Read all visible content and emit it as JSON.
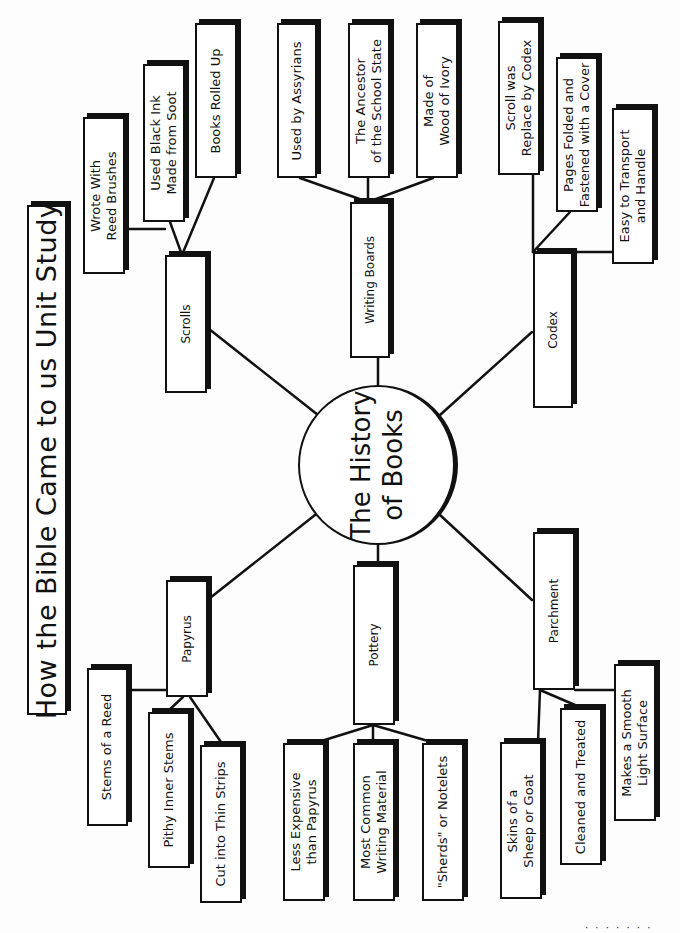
{
  "title": "How the Bible Came to us Unit Study",
  "center": {
    "label": "The History\nof Books"
  },
  "branches": {
    "scrolls": {
      "label": "Scrolls",
      "facts": [
        "Wrote With\nReed Brushes",
        "Used Black Ink\nMade from Soot",
        "Books Rolled Up"
      ]
    },
    "writing_boards": {
      "label": "Writing Boards",
      "facts": [
        "Used by Assyrians",
        "The Ancestor\nof the School State",
        "Made of\nWood of Ivory"
      ]
    },
    "codex": {
      "label": "Codex",
      "facts": [
        "Scroll was\nReplace by Codex",
        "Pages Folded and\nFastened with a Cover",
        "Easy to Transport\nand Handle"
      ]
    },
    "papyrus": {
      "label": "Papyrus",
      "facts": [
        "Stems of a Reed",
        "Pithy Inner Stems",
        "Cut into Thin Strips"
      ]
    },
    "pottery": {
      "label": "Pottery",
      "facts": [
        "Less Expensive\nthan Papyrus",
        "Most Common\nWriting Material",
        "\"Sherds\" or Notelets"
      ]
    },
    "parchment": {
      "label": "Parchment",
      "facts": [
        "Skins of a\nSheep or Goat",
        "Cleaned and Treated",
        "Makes a Smooth\nLight Surface"
      ]
    }
  },
  "footer": {
    "text": "· · · · · · ·"
  }
}
